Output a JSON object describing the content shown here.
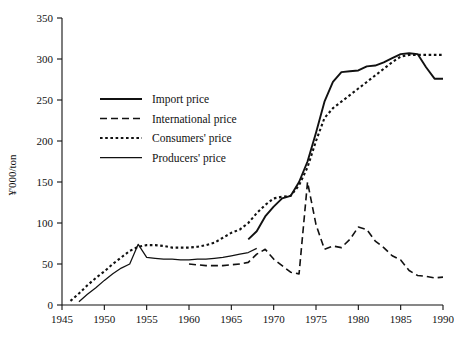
{
  "chart_data": {
    "type": "line",
    "title": "",
    "subtitle": "",
    "xlabel": "",
    "ylabel": "¥'000/ton",
    "xlim": [
      1945,
      1990
    ],
    "ylim": [
      0,
      350
    ],
    "xticks": [
      "1945",
      "1950",
      "1955",
      "1960",
      "1965",
      "1970",
      "1975",
      "1980",
      "1985",
      "1990"
    ],
    "yticks": [
      "0",
      "50",
      "100",
      "150",
      "200",
      "250",
      "300",
      "350"
    ],
    "grid": false,
    "legend_position": "upper-left-inside",
    "series": [
      {
        "name": "Import price",
        "style": "solid-thick",
        "color": "#111111",
        "x": [
          1967,
          1968,
          1969,
          1970,
          1971,
          1972,
          1973,
          1974,
          1975,
          1976,
          1977,
          1978,
          1979,
          1980,
          1981,
          1982,
          1983,
          1984,
          1985,
          1986,
          1987,
          1988,
          1989,
          1990
        ],
        "y": [
          80,
          90,
          108,
          120,
          130,
          133,
          150,
          175,
          210,
          248,
          272,
          284,
          285,
          286,
          291,
          292,
          296,
          301,
          306,
          307,
          306,
          290,
          276,
          276
        ]
      },
      {
        "name": "International price",
        "style": "dashed",
        "color": "#111111",
        "x": [
          1960,
          1961,
          1962,
          1963,
          1964,
          1965,
          1966,
          1967,
          1968,
          1969,
          1970,
          1971,
          1972,
          1973,
          1974,
          1975,
          1976,
          1977,
          1978,
          1979,
          1980,
          1981,
          1982,
          1983,
          1984,
          1985,
          1986,
          1987,
          1988,
          1989,
          1990
        ],
        "y": [
          50,
          49,
          48,
          48,
          48,
          49,
          50,
          52,
          62,
          68,
          56,
          48,
          40,
          38,
          150,
          98,
          68,
          72,
          70,
          80,
          95,
          92,
          78,
          70,
          60,
          55,
          42,
          36,
          35,
          33,
          34
        ]
      },
      {
        "name": "Consumers' price",
        "style": "dotted",
        "color": "#111111",
        "x": [
          1946,
          1947,
          1948,
          1949,
          1950,
          1951,
          1952,
          1953,
          1954,
          1955,
          1956,
          1957,
          1958,
          1959,
          1960,
          1961,
          1962,
          1963,
          1964,
          1965,
          1966,
          1967,
          1968,
          1969,
          1970,
          1971,
          1972,
          1973,
          1974,
          1975,
          1976,
          1977,
          1978,
          1979,
          1980,
          1981,
          1982,
          1983,
          1984,
          1985,
          1986,
          1987,
          1988,
          1989,
          1990
        ],
        "y": [
          5,
          14,
          24,
          33,
          41,
          50,
          58,
          66,
          71,
          73,
          73,
          72,
          70,
          70,
          70,
          71,
          73,
          76,
          82,
          88,
          92,
          100,
          112,
          122,
          130,
          132,
          133,
          146,
          168,
          200,
          228,
          240,
          248,
          256,
          264,
          272,
          280,
          288,
          296,
          303,
          305,
          305,
          305,
          305,
          305
        ]
      },
      {
        "name": "Producers' price",
        "style": "solid-thin",
        "color": "#111111",
        "x": [
          1947,
          1948,
          1949,
          1950,
          1951,
          1952,
          1953,
          1954,
          1955,
          1956,
          1957,
          1958,
          1959,
          1960,
          1961,
          1962,
          1963,
          1964,
          1965,
          1966,
          1967,
          1968
        ],
        "y": [
          4,
          13,
          21,
          30,
          38,
          45,
          50,
          74,
          58,
          57,
          56,
          56,
          55,
          55,
          56,
          56,
          57,
          58,
          60,
          62,
          64,
          69
        ]
      }
    ],
    "legend": [
      {
        "label": "Import price",
        "style": "solid-thick"
      },
      {
        "label": "International price",
        "style": "dashed"
      },
      {
        "label": "Consumers' price",
        "style": "dotted"
      },
      {
        "label": "Producers' price",
        "style": "solid-thin"
      }
    ]
  }
}
